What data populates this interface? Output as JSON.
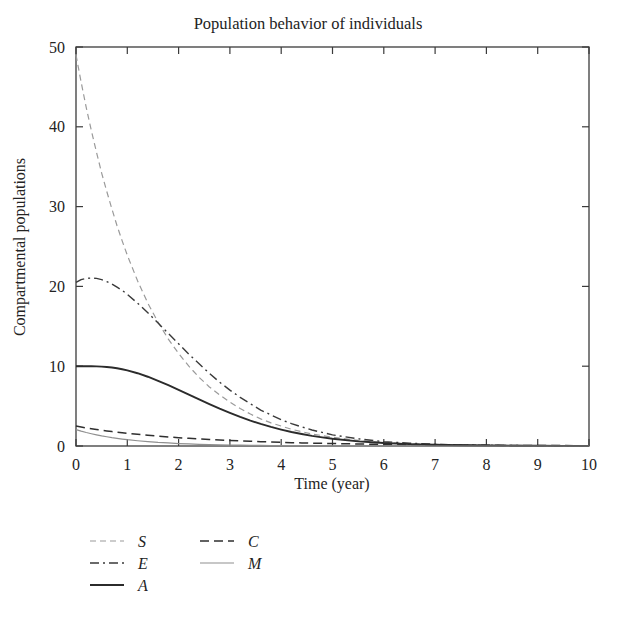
{
  "chart_data": {
    "type": "line",
    "title": "Population behavior of individuals",
    "xlabel": "Time (year)",
    "ylabel": "Compartmental populations",
    "xlim": [
      0,
      10
    ],
    "ylim": [
      0,
      50
    ],
    "xticks": [
      "0",
      "1",
      "2",
      "3",
      "4",
      "5",
      "6",
      "7",
      "8",
      "9",
      "10"
    ],
    "yticks": [
      "0",
      "10",
      "20",
      "30",
      "40",
      "50"
    ],
    "grid": false,
    "legend_position": "below-left",
    "x": [
      0,
      0.1,
      0.2,
      0.3,
      0.4,
      0.5,
      0.6,
      0.7,
      0.8,
      0.9,
      1,
      1.2,
      1.4,
      1.6,
      1.8,
      2,
      2.2,
      2.4,
      2.6,
      2.8,
      3,
      3.2,
      3.4,
      3.6,
      3.8,
      4,
      4.2,
      4.4,
      4.6,
      4.8,
      5,
      5.5,
      6,
      6.5,
      7,
      7.5,
      8,
      8.5,
      9,
      9.5,
      10
    ],
    "series": [
      {
        "name": "S",
        "label": "S",
        "style": "dashed",
        "color": "#9a9a9a",
        "width": 1.2,
        "values": [
          49,
          45.6,
          42.4,
          39.5,
          36.8,
          34.2,
          31.9,
          29.7,
          27.6,
          25.7,
          23.9,
          20.7,
          17.9,
          15.5,
          13.4,
          11.6,
          10.0,
          8.6,
          7.4,
          6.4,
          5.5,
          4.7,
          4.0,
          3.4,
          2.9,
          2.5,
          2.1,
          1.8,
          1.5,
          1.3,
          1.1,
          0.7,
          0.45,
          0.3,
          0.2,
          0.13,
          0.09,
          0.06,
          0.04,
          0.03,
          0.02
        ]
      },
      {
        "name": "E",
        "label": "E",
        "style": "dashdot",
        "color": "#3a3a3a",
        "width": 1.4,
        "values": [
          20.5,
          20.85,
          21.0,
          21.05,
          21.0,
          20.85,
          20.6,
          20.3,
          19.9,
          19.5,
          19.0,
          17.9,
          16.7,
          15.4,
          14.1,
          12.8,
          11.5,
          10.3,
          9.1,
          8.0,
          7.0,
          6.1,
          5.3,
          4.5,
          3.9,
          3.3,
          2.8,
          2.4,
          2.0,
          1.7,
          1.4,
          0.9,
          0.55,
          0.35,
          0.22,
          0.14,
          0.09,
          0.06,
          0.04,
          0.03,
          0.02
        ]
      },
      {
        "name": "A",
        "label": "A",
        "style": "solid",
        "color": "#2b2b2b",
        "width": 1.9,
        "values": [
          10.0,
          10.0,
          10.0,
          10.0,
          9.98,
          9.95,
          9.9,
          9.83,
          9.74,
          9.62,
          9.48,
          9.12,
          8.68,
          8.17,
          7.62,
          7.03,
          6.43,
          5.83,
          5.24,
          4.67,
          4.14,
          3.64,
          3.18,
          2.77,
          2.39,
          2.06,
          1.76,
          1.5,
          1.27,
          1.08,
          0.91,
          0.58,
          0.37,
          0.23,
          0.15,
          0.09,
          0.06,
          0.04,
          0.025,
          0.018,
          0.012
        ]
      },
      {
        "name": "C",
        "label": "C",
        "style": "dashed-long",
        "color": "#2f2f2f",
        "width": 1.5,
        "values": [
          2.5,
          2.38,
          2.27,
          2.17,
          2.07,
          1.98,
          1.89,
          1.81,
          1.73,
          1.66,
          1.59,
          1.46,
          1.34,
          1.23,
          1.13,
          1.04,
          0.96,
          0.88,
          0.81,
          0.75,
          0.69,
          0.64,
          0.59,
          0.54,
          0.5,
          0.46,
          0.42,
          0.39,
          0.36,
          0.33,
          0.31,
          0.25,
          0.2,
          0.16,
          0.13,
          0.11,
          0.09,
          0.07,
          0.06,
          0.05,
          0.04
        ]
      },
      {
        "name": "M",
        "label": "M",
        "style": "solid-light",
        "color": "#8f8f8f",
        "width": 1.2,
        "values": [
          2.05,
          1.86,
          1.69,
          1.54,
          1.4,
          1.27,
          1.16,
          1.05,
          0.96,
          0.87,
          0.79,
          0.66,
          0.55,
          0.45,
          0.38,
          0.31,
          0.26,
          0.21,
          0.18,
          0.15,
          0.12,
          0.1,
          0.085,
          0.07,
          0.058,
          0.048,
          0.04,
          0.033,
          0.027,
          0.022,
          0.018,
          0.011,
          0.007,
          0.004,
          0.003,
          0.002,
          0.001,
          0.001,
          0.0005,
          0.0003,
          0.0002
        ]
      }
    ],
    "legend": [
      {
        "label": "S",
        "column": 0,
        "row": 0
      },
      {
        "label": "E",
        "column": 0,
        "row": 1
      },
      {
        "label": "A",
        "column": 0,
        "row": 2
      },
      {
        "label": "C",
        "column": 1,
        "row": 0
      },
      {
        "label": "M",
        "column": 1,
        "row": 1
      }
    ]
  }
}
